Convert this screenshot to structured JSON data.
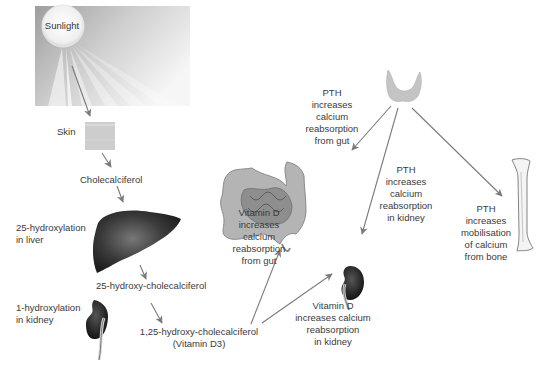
{
  "diagram": {
    "nodes": {
      "sunlight": "Sunlight",
      "skin": "Skin",
      "cholecalciferol": "Cholecalciferol",
      "liver_step": [
        "25-hydroxylation",
        "in liver"
      ],
      "hydroxy_chole": "25-hydroxy-cholecalciferol",
      "kidney_step": [
        "1-hydroxylation",
        "in kidney"
      ],
      "active_vitd": [
        "1,25-hydroxy-cholecalciferol",
        "(Vitamin D3)"
      ],
      "vitd_gut": [
        "Vitamin D",
        "increases",
        "calcium",
        "reabsorption",
        "from gut"
      ],
      "vitd_kidney": [
        "Vitamin D",
        "increases calcium",
        "reabsorption",
        "in kidney"
      ],
      "pth_gut": [
        "PTH",
        "increases",
        "calcium",
        "reabsorption",
        "from gut"
      ],
      "pth_kidney": [
        "PTH",
        "increases",
        "calcium",
        "reabsorption",
        "in kidney"
      ],
      "pth_bone": [
        "PTH",
        "increases",
        "mobilisation",
        "of calcium",
        "from bone"
      ]
    },
    "icons": [
      "sun-icon",
      "skin-icon",
      "liver-icon",
      "kidney-icon",
      "thyroid-icon",
      "intestine-icon",
      "bone-icon"
    ],
    "colors": {
      "arrow": "#7a7a7a",
      "organ_dark": "#2b2b2b",
      "skin": "#c8c8c8",
      "sunbox": "#bdbdbd",
      "intestine": "#a8a8a8",
      "bone_fill": "#f4f4f4"
    },
    "edges": [
      {
        "from": "Sunlight",
        "to": "Skin"
      },
      {
        "from": "Skin",
        "to": "Cholecalciferol"
      },
      {
        "from": "Cholecalciferol",
        "to": "Liver"
      },
      {
        "from": "Liver",
        "to": "25-hydroxy-cholecalciferol"
      },
      {
        "from": "25-hydroxy-cholecalciferol",
        "to": "1,25-hydroxy-cholecalciferol (Vitamin D3)"
      },
      {
        "from": "Vitamin D3",
        "to": "Gut"
      },
      {
        "from": "Vitamin D3",
        "to": "Kidney"
      },
      {
        "from": "Thyroid (PTH)",
        "to": "Gut"
      },
      {
        "from": "Thyroid (PTH)",
        "to": "Kidney"
      },
      {
        "from": "Thyroid (PTH)",
        "to": "Bone"
      }
    ]
  }
}
